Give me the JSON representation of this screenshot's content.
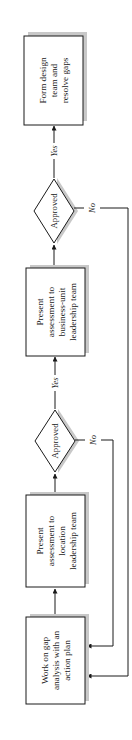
{
  "diagram": {
    "type": "flowchart",
    "orientation": "rotated-90-ccw",
    "colors": {
      "stroke": "#1a1a1a",
      "shadow": "#c8c8c8",
      "fill": "#ffffff"
    },
    "nodes": [
      {
        "id": "n1",
        "shape": "process",
        "lines": [
          "Work on gap",
          "analysis with an",
          "action plan"
        ]
      },
      {
        "id": "n2",
        "shape": "process",
        "lines": [
          "Present",
          "assessment to",
          "location",
          "leadership team"
        ]
      },
      {
        "id": "n3",
        "shape": "decision",
        "label": "Approved"
      },
      {
        "id": "n4",
        "shape": "process",
        "lines": [
          "Present",
          "assessment to",
          "business-unit",
          "leadership team"
        ]
      },
      {
        "id": "n5",
        "shape": "decision",
        "label": "Approved"
      },
      {
        "id": "n6",
        "shape": "process",
        "lines": [
          "Form design",
          "team and",
          "resolve gaps"
        ]
      }
    ],
    "edges": [
      {
        "from": "n1",
        "to": "n2",
        "label": ""
      },
      {
        "from": "n2",
        "to": "n3",
        "label": ""
      },
      {
        "from": "n3",
        "to": "n4",
        "label": "Yes"
      },
      {
        "from": "n3",
        "to": "n1",
        "label": "No"
      },
      {
        "from": "n4",
        "to": "n5",
        "label": ""
      },
      {
        "from": "n5",
        "to": "n6",
        "label": "Yes"
      },
      {
        "from": "n5",
        "to": "n1",
        "label": "No"
      }
    ]
  }
}
